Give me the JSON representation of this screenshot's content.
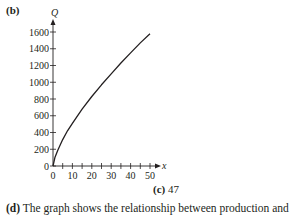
{
  "part_label": "(b)",
  "caption": {
    "label": "(c)",
    "value": "47"
  },
  "next_text": {
    "label": "(d)",
    "text": "The graph shows the relationship between production and"
  },
  "chart_data": {
    "type": "line",
    "title": "",
    "xlabel": "x",
    "ylabel": "Q",
    "xlim": [
      0,
      50
    ],
    "ylim": [
      0,
      1600
    ],
    "x_ticks": [
      0,
      10,
      20,
      30,
      40,
      50
    ],
    "x_minor_step": 5,
    "y_ticks": [
      0,
      200,
      400,
      600,
      800,
      1000,
      1200,
      1400,
      1600
    ],
    "grid": false,
    "legend": null,
    "series": [
      {
        "name": "Q(x)",
        "x": [
          0,
          1,
          2.5,
          5,
          7.5,
          10,
          15,
          20,
          25,
          30,
          35,
          40,
          45,
          50
        ],
        "y": [
          0,
          100,
          190,
          315,
          420,
          510,
          680,
          830,
          970,
          1100,
          1230,
          1350,
          1470,
          1580
        ]
      }
    ],
    "color": "#231f20"
  }
}
